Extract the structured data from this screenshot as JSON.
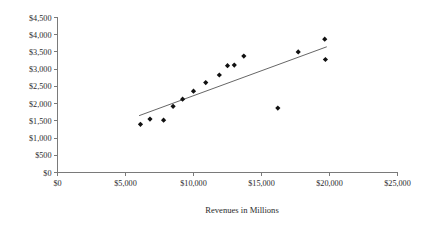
{
  "chart_data": {
    "type": "scatter",
    "title": "",
    "subtitle": "",
    "xlabel": "Revenues in Millions",
    "ylabel": "",
    "xlim": [
      0,
      25000
    ],
    "ylim": [
      0,
      4500
    ],
    "grid": false,
    "legend": null,
    "x_ticks": [
      0,
      5000,
      10000,
      15000,
      20000,
      25000
    ],
    "x_tick_labels": [
      "$0",
      "$5,000",
      "$10,000",
      "$15,000",
      "$20,000",
      "$25,000"
    ],
    "y_ticks": [
      0,
      500,
      1000,
      1500,
      2000,
      2500,
      3000,
      3500,
      4000,
      4500
    ],
    "y_tick_labels": [
      "$0",
      "$500",
      "$1,000",
      "$1,500",
      "$2,000",
      "$2,500",
      "$3,000",
      "$3,500",
      "$4,000",
      "$4,500"
    ],
    "marker": "diamond",
    "marker_color": "#111111",
    "points": [
      {
        "x": 6100,
        "y": 1400
      },
      {
        "x": 6800,
        "y": 1550
      },
      {
        "x": 7800,
        "y": 1520
      },
      {
        "x": 8500,
        "y": 1920
      },
      {
        "x": 9200,
        "y": 2130
      },
      {
        "x": 10000,
        "y": 2360
      },
      {
        "x": 10900,
        "y": 2610
      },
      {
        "x": 11900,
        "y": 2830
      },
      {
        "x": 12500,
        "y": 3100
      },
      {
        "x": 13000,
        "y": 3120
      },
      {
        "x": 13700,
        "y": 3380
      },
      {
        "x": 16200,
        "y": 1870
      },
      {
        "x": 17700,
        "y": 3500
      },
      {
        "x": 19650,
        "y": 3870
      },
      {
        "x": 19700,
        "y": 3280
      }
    ],
    "trendline": {
      "type": "linear",
      "x_start": 6000,
      "y_start": 1650,
      "x_end": 19800,
      "y_end": 3650,
      "color": "#555555"
    }
  }
}
